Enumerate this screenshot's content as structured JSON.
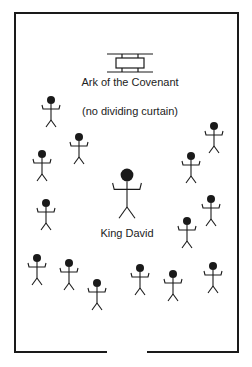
{
  "diagram": {
    "ark_label": "Ark of the Covenant",
    "curtain_note": "(no dividing curtain)",
    "king_label": "King David",
    "colors": {
      "stroke": "#1a1a1a",
      "background": "#ffffff"
    },
    "figures": [
      {
        "x": 51,
        "y": 100,
        "scale": 1
      },
      {
        "x": 42,
        "y": 154,
        "scale": 1
      },
      {
        "x": 79,
        "y": 137,
        "scale": 1
      },
      {
        "x": 46,
        "y": 203,
        "scale": 1
      },
      {
        "x": 214,
        "y": 126,
        "scale": 1
      },
      {
        "x": 191,
        "y": 156,
        "scale": 1
      },
      {
        "x": 211,
        "y": 199,
        "scale": 1
      },
      {
        "x": 187,
        "y": 221,
        "scale": 1
      },
      {
        "x": 37,
        "y": 258,
        "scale": 1
      },
      {
        "x": 69,
        "y": 263,
        "scale": 1
      },
      {
        "x": 97,
        "y": 283,
        "scale": 1
      },
      {
        "x": 140,
        "y": 268,
        "scale": 1
      },
      {
        "x": 173,
        "y": 274,
        "scale": 1
      },
      {
        "x": 213,
        "y": 266,
        "scale": 1
      }
    ],
    "king": {
      "x": 127,
      "y": 175,
      "scale": 1.6
    }
  }
}
